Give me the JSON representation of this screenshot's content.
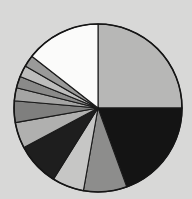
{
  "chart_data": {
    "type": "pie",
    "title": "",
    "subtitle": "",
    "xlabel": "",
    "ylabel": "",
    "legend": false,
    "grid": false,
    "start_angle_deg": 90,
    "direction": "clockwise",
    "center": {
      "x": 98,
      "y": 108
    },
    "radius": 84,
    "background_color": "#d8d8d7",
    "edge_color": "#1a1a1a",
    "categories": [
      "Slice 1",
      "Slice 2",
      "Slice 3",
      "Slice 4",
      "Slice 5",
      "Slice 6",
      "Slice 7",
      "Slice 8",
      "Slice 9",
      "Slice 10",
      "Slice 11",
      "Slice 12"
    ],
    "values": [
      25.0,
      19.4,
      8.3,
      6.1,
      8.3,
      5.0,
      4.2,
      2.5,
      2.2,
      2.2,
      2.2,
      14.6
    ],
    "angles_deg": [
      90.0,
      70.0,
      30.0,
      22.0,
      30.0,
      18.0,
      15.0,
      9.0,
      8.0,
      8.0,
      8.0,
      52.0
    ],
    "colors": [
      "#b7b7b6",
      "#141414",
      "#8d8d8c",
      "#c6c6c5",
      "#1e1e1e",
      "#b0b0af",
      "#7f7f7e",
      "#a5a5a4",
      "#8a8a89",
      "#bdbdbc",
      "#9a9a99",
      "#fbfbfa"
    ],
    "slices": [
      {
        "label": "Slice 1",
        "value": 25.0,
        "angle_deg": 90.0,
        "color": "#b7b7b6"
      },
      {
        "label": "Slice 2",
        "value": 19.4,
        "angle_deg": 70.0,
        "color": "#141414"
      },
      {
        "label": "Slice 3",
        "value": 8.3,
        "angle_deg": 30.0,
        "color": "#8d8d8c"
      },
      {
        "label": "Slice 4",
        "value": 6.1,
        "angle_deg": 22.0,
        "color": "#c6c6c5"
      },
      {
        "label": "Slice 5",
        "value": 8.3,
        "angle_deg": 30.0,
        "color": "#1e1e1e"
      },
      {
        "label": "Slice 6",
        "value": 5.0,
        "angle_deg": 18.0,
        "color": "#b0b0af"
      },
      {
        "label": "Slice 7",
        "value": 4.2,
        "angle_deg": 15.0,
        "color": "#7f7f7e"
      },
      {
        "label": "Slice 8",
        "value": 2.5,
        "angle_deg": 9.0,
        "color": "#a5a5a4"
      },
      {
        "label": "Slice 9",
        "value": 2.2,
        "angle_deg": 8.0,
        "color": "#8a8a89"
      },
      {
        "label": "Slice 10",
        "value": 2.2,
        "angle_deg": 8.0,
        "color": "#bdbdbc"
      },
      {
        "label": "Slice 11",
        "value": 2.2,
        "angle_deg": 8.0,
        "color": "#9a9a99"
      },
      {
        "label": "Slice 12",
        "value": 14.6,
        "angle_deg": 52.0,
        "color": "#fbfbfa"
      }
    ]
  }
}
